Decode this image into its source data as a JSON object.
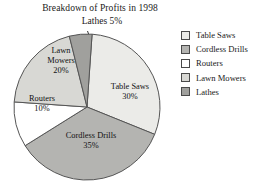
{
  "chart_data": {
    "type": "pie",
    "title": "Breakdown of Profits in 1998",
    "xlabel": "",
    "ylabel": "",
    "legend_position": "right",
    "grid": false,
    "categories": [
      "Table Saws",
      "Cordless Drills",
      "Routers",
      "Lawn Mowers",
      "Lathes"
    ],
    "values": [
      30,
      35,
      10,
      20,
      5
    ],
    "value_unit": "%",
    "slice_labels": [
      "Table Saws 30%",
      "Cordless Drills 35%",
      "Routers 10%",
      "Lawn Mowers 20%",
      "Lathes 5%"
    ],
    "colors": [
      "#ebebe8",
      "#b4b4b1",
      "#ffffff",
      "#d8d8d4",
      "#a0a09d"
    ],
    "annotations": [
      "Lathes 5% labeled outside the pie with a leader line"
    ]
  },
  "figure": {
    "title": "Breakdown of Profits in 1998",
    "callout": {
      "label": "Lathes 5%"
    },
    "slices": [
      {
        "name": "Table Saws",
        "label": "Table Saws",
        "percent": "30%",
        "color": "#ebebe8"
      },
      {
        "name": "Cordless Drills",
        "label": "Cordless Drills",
        "percent": "35%",
        "color": "#b4b4b1"
      },
      {
        "name": "Routers",
        "label": "Routers",
        "percent": "10%",
        "color": "#ffffff"
      },
      {
        "name": "Lawn Mowers",
        "label": "Lawn Mowers",
        "percent": "20%",
        "color": "#d8d8d4"
      },
      {
        "name": "Lathes",
        "label": "Lathes",
        "percent": "5%",
        "color": "#a0a09d"
      }
    ],
    "legend": {
      "items": [
        {
          "label": "Table Saws",
          "color": "#ebebe8"
        },
        {
          "label": "Cordless Drills",
          "color": "#b4b4b1"
        },
        {
          "label": "Routers",
          "color": "#ffffff"
        },
        {
          "label": "Lawn Mowers",
          "color": "#d8d8d4"
        },
        {
          "label": "Lathes",
          "color": "#a0a09d"
        }
      ]
    },
    "stroke_color": "#555555",
    "background": "#ffffff"
  }
}
